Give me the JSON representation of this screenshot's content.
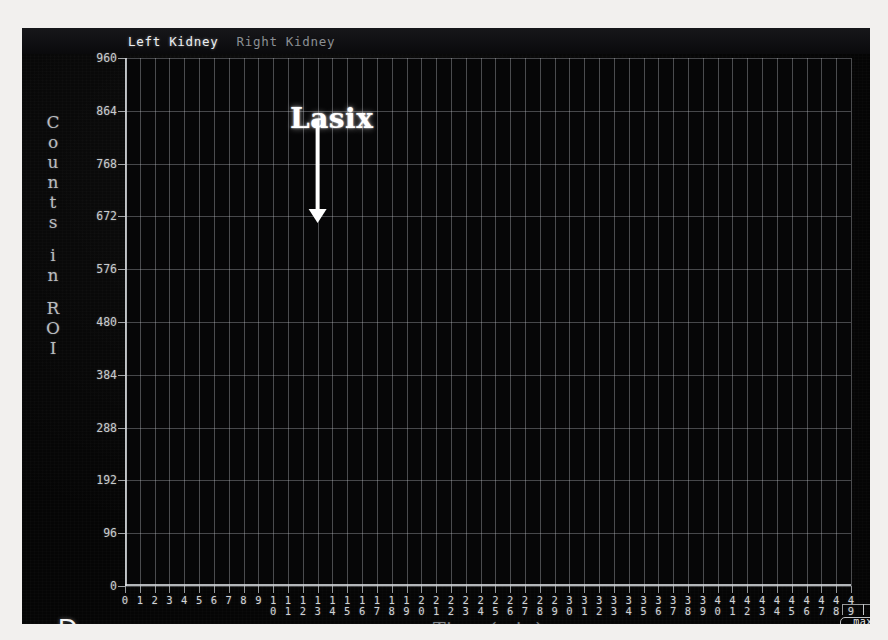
{
  "panel": {
    "letter": "D"
  },
  "legend": {
    "left_series": "Left Kidney",
    "right_series": "Right Kidney",
    "left_color": "#f2f4f6",
    "right_color": "#8b8f93"
  },
  "annotation": {
    "label": "Lasix"
  },
  "maxbox": {
    "label": "max"
  },
  "axes": {
    "y_title_letters": [
      "C",
      "o",
      "u",
      "n",
      "t",
      "s",
      "",
      "i",
      "n",
      "",
      "R",
      "O",
      "I"
    ],
    "y_title": "Counts in ROI",
    "x_title": "Time (min)",
    "y_ticks": [
      0,
      96,
      192,
      288,
      384,
      480,
      576,
      672,
      768,
      864,
      960
    ],
    "x_ticks": [
      0,
      1,
      2,
      3,
      4,
      5,
      6,
      7,
      8,
      9,
      10,
      11,
      12,
      13,
      14,
      15,
      16,
      17,
      18,
      19,
      20,
      21,
      22,
      23,
      24,
      25,
      26,
      27,
      28,
      29,
      30,
      31,
      32,
      33,
      34,
      35,
      36,
      37,
      38,
      39,
      40,
      41,
      42,
      43,
      44,
      45,
      46,
      47,
      48,
      49
    ]
  },
  "chart_data": {
    "type": "line",
    "title": "",
    "xlabel": "Time (min)",
    "ylabel": "Counts in ROI",
    "xlim": [
      0,
      49
    ],
    "ylim": [
      0,
      960
    ],
    "grid": true,
    "legend_position": "top-left",
    "annotations": [
      {
        "text": "Lasix",
        "x": 13,
        "y": 880,
        "arrow": "down",
        "arrow_to_y": 660
      }
    ],
    "x": [
      0,
      1,
      2,
      3,
      4,
      5,
      6,
      7,
      8,
      9,
      10,
      11,
      12,
      13,
      14,
      15,
      16,
      17,
      18,
      19,
      20,
      21,
      22,
      23,
      24,
      25,
      26,
      27,
      28,
      29,
      30,
      31,
      32,
      33,
      34,
      35,
      36,
      37,
      38,
      39,
      40,
      41,
      42,
      43,
      44,
      45,
      46,
      47,
      48,
      49
    ],
    "series": [
      {
        "name": "Left Kidney",
        "color": "#f2f4f6",
        "values": [
          10,
          22,
          150,
          300,
          420,
          500,
          472,
          520,
          560,
          576,
          590,
          600,
          620,
          650,
          665,
          672,
          690,
          740,
          790,
          780,
          785,
          800,
          775,
          790,
          760,
          800,
          845,
          845,
          820,
          815,
          830,
          865,
          855,
          840,
          880,
          935,
          940,
          930,
          925,
          930,
          900,
          900,
          930,
          955,
          960,
          930,
          890,
          900,
          855,
          710
        ]
      },
      {
        "name": "Right Kidney",
        "color": "#a8acb0",
        "values": [
          8,
          30,
          250,
          440,
          620,
          760,
          800,
          810,
          700,
          600,
          520,
          440,
          380,
          330,
          300,
          290,
          288,
          280,
          272,
          262,
          258,
          252,
          240,
          200,
          160,
          150,
          148,
          152,
          142,
          140,
          132,
          128,
          126,
          130,
          140,
          142,
          140,
          130,
          135,
          145,
          160,
          168,
          168,
          180,
          190,
          200,
          212,
          215,
          216,
          150
        ]
      }
    ]
  }
}
